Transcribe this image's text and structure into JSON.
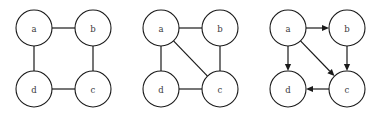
{
  "figure": {
    "background_color": "#ffffff",
    "stroke_color": "#1a1a1a",
    "label_color": "#3a3a3a",
    "node_radius": 18,
    "width": 381,
    "height": 122
  },
  "chart_data": {
    "type": "diagram",
    "diagram_kind": "graph",
    "title": "",
    "panels": [
      {
        "id": "graph-1",
        "caption": "",
        "directed": false,
        "nodes": [
          {
            "id": "a",
            "label": "a",
            "x": 34,
            "y": 28
          },
          {
            "id": "b",
            "label": "b",
            "x": 93,
            "y": 28
          },
          {
            "id": "c",
            "label": "c",
            "x": 93,
            "y": 89
          },
          {
            "id": "d",
            "label": "d",
            "x": 34,
            "y": 89
          }
        ],
        "edges": [
          {
            "from": "a",
            "to": "b",
            "directed": false
          },
          {
            "from": "b",
            "to": "c",
            "directed": false
          },
          {
            "from": "c",
            "to": "d",
            "directed": false
          },
          {
            "from": "d",
            "to": "a",
            "directed": false
          }
        ]
      },
      {
        "id": "graph-2",
        "caption": "",
        "directed": false,
        "nodes": [
          {
            "id": "a",
            "label": "a",
            "x": 34,
            "y": 28
          },
          {
            "id": "b",
            "label": "b",
            "x": 93,
            "y": 28
          },
          {
            "id": "c",
            "label": "c",
            "x": 93,
            "y": 89
          },
          {
            "id": "d",
            "label": "d",
            "x": 34,
            "y": 89
          }
        ],
        "edges": [
          {
            "from": "a",
            "to": "b",
            "directed": false
          },
          {
            "from": "b",
            "to": "c",
            "directed": false
          },
          {
            "from": "c",
            "to": "d",
            "directed": false
          },
          {
            "from": "d",
            "to": "a",
            "directed": false
          },
          {
            "from": "a",
            "to": "c",
            "directed": false
          }
        ]
      },
      {
        "id": "graph-3",
        "caption": "",
        "directed": true,
        "nodes": [
          {
            "id": "a",
            "label": "a",
            "x": 34,
            "y": 28
          },
          {
            "id": "b",
            "label": "b",
            "x": 93,
            "y": 28
          },
          {
            "id": "c",
            "label": "c",
            "x": 93,
            "y": 89
          },
          {
            "id": "d",
            "label": "d",
            "x": 34,
            "y": 89
          }
        ],
        "edges": [
          {
            "from": "a",
            "to": "b",
            "directed": true
          },
          {
            "from": "a",
            "to": "d",
            "directed": true
          },
          {
            "from": "a",
            "to": "c",
            "directed": true
          },
          {
            "from": "b",
            "to": "c",
            "directed": true
          },
          {
            "from": "c",
            "to": "d",
            "directed": true
          }
        ]
      }
    ]
  }
}
